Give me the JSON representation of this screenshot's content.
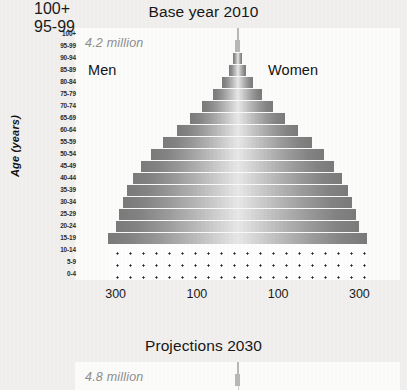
{
  "sections": {
    "top": {
      "title": "Base year 2010",
      "note": "4.2 million",
      "men_label": "Men",
      "women_label": "Women"
    },
    "bottom": {
      "title": "Projections 2030",
      "note": "4.8 million"
    }
  },
  "axes": {
    "y_title": "Age (years)",
    "x_ticks": [
      "300",
      "100",
      "100",
      "300"
    ]
  },
  "age_groups": [
    "100+",
    "95-99",
    "90-94",
    "85-89",
    "80-84",
    "75-79",
    "70-74",
    "65-69",
    "60-64",
    "55-59",
    "50-54",
    "45-49",
    "40-44",
    "35-39",
    "30-34",
    "25-29",
    "20-24",
    "15-19",
    "10-14",
    "5-9",
    "0-4"
  ],
  "chart_data": {
    "type": "bar",
    "subtype": "population-pyramid",
    "title": "Base year 2010",
    "subtitle": "4.2 million",
    "xlabel": "",
    "ylabel": "Age (years)",
    "orientation": "horizontal",
    "grid": false,
    "legend": "none",
    "xlim": [
      -400,
      400
    ],
    "x_tick_values": [
      -300,
      -100,
      100,
      300
    ],
    "x_tick_labels": [
      "300",
      "100",
      "100",
      "300"
    ],
    "categories": [
      "100+",
      "95-99",
      "90-94",
      "85-89",
      "80-84",
      "75-79",
      "70-74",
      "65-69",
      "60-64",
      "55-59",
      "50-54",
      "45-49",
      "40-44",
      "35-39",
      "30-34",
      "25-29",
      "20-24",
      "15-19",
      "10-14",
      "5-9",
      "0-4"
    ],
    "series": [
      {
        "name": "Men",
        "side": "left",
        "values": [
          2,
          5,
          12,
          22,
          38,
          60,
          88,
          118,
          150,
          183,
          212,
          238,
          258,
          272,
          282,
          292,
          300,
          318,
          318,
          318,
          318
        ]
      },
      {
        "name": "Women",
        "side": "right",
        "values": [
          2,
          5,
          12,
          22,
          38,
          60,
          88,
          118,
          150,
          183,
          212,
          238,
          258,
          272,
          282,
          292,
          300,
          318,
          318,
          318,
          318
        ]
      }
    ],
    "annotations": [
      {
        "text": "4.2 million",
        "position": "top-left"
      },
      {
        "text": "Men",
        "position": "upper-left"
      },
      {
        "text": "Women",
        "position": "upper-right"
      }
    ],
    "style_notes": {
      "fill_gradient": "light at center, dark at edges",
      "dotted_rows": [
        "10-14",
        "5-9",
        "0-4"
      ]
    }
  },
  "chart_data_2030": {
    "type": "bar",
    "subtype": "population-pyramid",
    "title": "Projections 2030",
    "subtitle": "4.8 million",
    "ylabel": "Age (years)",
    "categories_visible": [
      "100+",
      "95-99"
    ],
    "note": "chart cropped at bottom of screenshot"
  },
  "colors": {
    "page_background": "#f2f1ef",
    "plot_background": "#fdfdfc",
    "bar_edge": "#7b7b7b",
    "bar_center": "#e9e9e9",
    "note_text": "#8e8e8e",
    "axis_line": "#cfcfcf"
  }
}
